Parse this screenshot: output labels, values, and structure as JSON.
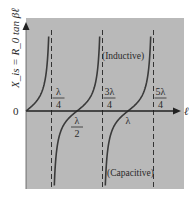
{
  "chart_data": {
    "type": "line",
    "title": "",
    "xlabel": "ℓ",
    "ylabel": "X_is = R_0 tan βℓ",
    "origin_label": "0",
    "x_ticks": [
      {
        "value": 0.25,
        "num": "λ",
        "den": "4",
        "position": "above"
      },
      {
        "value": 0.5,
        "num": "λ",
        "den": "2",
        "position": "below"
      },
      {
        "value": 0.75,
        "num": "3λ",
        "den": "4",
        "position": "above"
      },
      {
        "value": 1.0,
        "num": "λ",
        "den": "",
        "position": "below"
      },
      {
        "value": 1.25,
        "num": "5λ",
        "den": "4",
        "position": "above"
      }
    ],
    "asymptotes": [
      0.25,
      0.75,
      1.25
    ],
    "zeros": [
      0,
      0.5,
      1.0
    ],
    "function": "tan(2π ℓ/λ)",
    "x_range_wavelengths": [
      0,
      1.25
    ],
    "annotations": [
      {
        "text": "(Inductive)",
        "region": "positive"
      },
      {
        "text": "(Capacitive)",
        "region": "negative"
      }
    ],
    "grid": false,
    "colors": {
      "background": "#b9b9b9",
      "curve": "#3a3a3a",
      "axis": "#222222",
      "dashed": "#333333"
    }
  }
}
